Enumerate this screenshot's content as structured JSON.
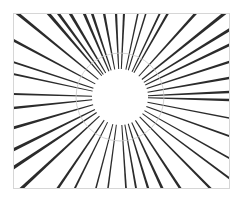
{
  "figure": {
    "width": 239,
    "height": 199,
    "background": "#ffffff",
    "frame": {
      "x": 13,
      "y": 13,
      "w": 216,
      "h": 175,
      "stroke": "#d6d6d6",
      "stroke_width": 1
    },
    "center": {
      "x": 120,
      "y": 97
    },
    "inner_clear_radius": 28,
    "guide_circle": {
      "radius": 44,
      "stroke": "#c8c8c8",
      "stroke_width": 1
    },
    "ray_color": "#2b2b2b",
    "rays": [
      {
        "end": [
          17,
          13
        ],
        "width": 3.2
      },
      {
        "end": [
          48,
          13
        ],
        "width": 3.4
      },
      {
        "end": [
          58,
          13
        ],
        "width": 3.0
      },
      {
        "end": [
          70,
          13
        ],
        "width": 3.2
      },
      {
        "end": [
          84,
          13
        ],
        "width": 3.0
      },
      {
        "end": [
          92,
          13
        ],
        "width": 2.8
      },
      {
        "end": [
          104,
          13
        ],
        "width": 2.6
      },
      {
        "end": [
          116,
          13
        ],
        "width": 2.4
      },
      {
        "end": [
          124,
          13
        ],
        "width": 2.2
      },
      {
        "end": [
          138,
          13
        ],
        "width": 1.6
      },
      {
        "end": [
          146,
          13
        ],
        "width": 1.6
      },
      {
        "end": [
          160,
          13
        ],
        "width": 2.0
      },
      {
        "end": [
          168,
          13
        ],
        "width": 2.4
      },
      {
        "end": [
          196,
          13
        ],
        "width": 2.8
      },
      {
        "end": [
          225,
          13
        ],
        "width": 3.4
      },
      {
        "end": [
          229,
          30
        ],
        "width": 3.2
      },
      {
        "end": [
          229,
          45
        ],
        "width": 2.8
      },
      {
        "end": [
          229,
          62
        ],
        "width": 2.6
      },
      {
        "end": [
          229,
          78
        ],
        "width": 2.4
      },
      {
        "end": [
          229,
          92
        ],
        "width": 2.6
      },
      {
        "end": [
          229,
          100
        ],
        "width": 2.4
      },
      {
        "end": [
          229,
          118
        ],
        "width": 1.6
      },
      {
        "end": [
          229,
          136
        ],
        "width": 1.8
      },
      {
        "end": [
          229,
          158
        ],
        "width": 2.0
      },
      {
        "end": [
          229,
          178
        ],
        "width": 2.2
      },
      {
        "end": [
          210,
          188
        ],
        "width": 2.4
      },
      {
        "end": [
          180,
          188
        ],
        "width": 2.6
      },
      {
        "end": [
          162,
          188
        ],
        "width": 2.8
      },
      {
        "end": [
          148,
          188
        ],
        "width": 2.4
      },
      {
        "end": [
          136,
          188
        ],
        "width": 2.0
      },
      {
        "end": [
          126,
          188
        ],
        "width": 1.8
      },
      {
        "end": [
          108,
          188
        ],
        "width": 1.6
      },
      {
        "end": [
          96,
          188
        ],
        "width": 1.6
      },
      {
        "end": [
          75,
          188
        ],
        "width": 2.0
      },
      {
        "end": [
          58,
          188
        ],
        "width": 2.6
      },
      {
        "end": [
          22,
          188
        ],
        "width": 3.4
      },
      {
        "end": [
          13,
          168
        ],
        "width": 3.4
      },
      {
        "end": [
          13,
          150
        ],
        "width": 3.2
      },
      {
        "end": [
          13,
          128
        ],
        "width": 2.8
      },
      {
        "end": [
          13,
          108
        ],
        "width": 2.4
      },
      {
        "end": [
          13,
          94
        ],
        "width": 2.2
      },
      {
        "end": [
          13,
          74
        ],
        "width": 1.8
      },
      {
        "end": [
          13,
          62
        ],
        "width": 2.0
      },
      {
        "end": [
          13,
          40
        ],
        "width": 2.6
      }
    ]
  }
}
